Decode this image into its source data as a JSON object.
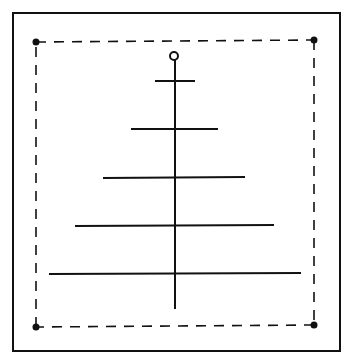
{
  "diagram": {
    "colors": {
      "stroke": "#111111",
      "background": "#ffffff"
    },
    "frame": {
      "x": 13,
      "y": 13,
      "w": 327,
      "h": 338
    },
    "dashed_rect": {
      "corners": [
        [
          36,
          42
        ],
        [
          314,
          40
        ],
        [
          314,
          325
        ],
        [
          36,
          327
        ]
      ]
    },
    "top_circle": {
      "cx": 174,
      "cy": 56,
      "r": 4
    },
    "trunk": {
      "x": 175,
      "y1": 60,
      "y2": 309
    },
    "branches": [
      {
        "y": 81,
        "x1": 155,
        "x2": 195
      },
      {
        "y": 129,
        "x1": 131,
        "x2": 218
      },
      {
        "y": 178,
        "x1": 103,
        "x2": 245
      },
      {
        "y": 226,
        "x1": 75,
        "x2": 274
      },
      {
        "y": 273,
        "x1": 49,
        "x2": 301
      }
    ]
  }
}
